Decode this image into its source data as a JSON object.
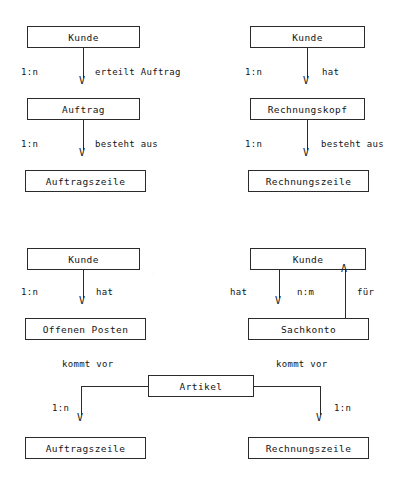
{
  "document": {
    "title": "Entity-Relationship Diagramm",
    "background_color": "#ffffff",
    "line_color": "#2b2b2b",
    "text_color": "#141414"
  },
  "entities": {
    "kunde_1": {
      "label": "Kunde",
      "x": 27,
      "y": 26,
      "w": 113,
      "h": 22
    },
    "auftrag": {
      "label": "Auftrag",
      "x": 27,
      "y": 98,
      "w": 113,
      "h": 22
    },
    "auftragszeile_1": {
      "label": "Auftragszeile",
      "x": 25,
      "y": 170,
      "w": 121,
      "h": 22
    },
    "kunde_2": {
      "label": "Kunde",
      "x": 250,
      "y": 26,
      "w": 115,
      "h": 22
    },
    "rechnungskopf": {
      "label": "Rechnungskopf",
      "x": 250,
      "y": 98,
      "w": 115,
      "h": 22
    },
    "rechnungszeile_1": {
      "label": "Rechnungszeile",
      "x": 248,
      "y": 170,
      "w": 121,
      "h": 22
    },
    "kunde_3": {
      "label": "Kunde",
      "x": 27,
      "y": 248,
      "w": 113,
      "h": 22
    },
    "offenen_posten": {
      "label": "Offenen Posten",
      "x": 25,
      "y": 318,
      "w": 121,
      "h": 22
    },
    "kunde_4": {
      "label": "Kunde",
      "x": 250,
      "y": 248,
      "w": 116,
      "h": 22
    },
    "sachkonto": {
      "label": "Sachkonto",
      "x": 248,
      "y": 318,
      "w": 121,
      "h": 22
    },
    "artikel": {
      "label": "Artikel",
      "x": 148,
      "y": 375,
      "w": 106,
      "h": 22
    },
    "auftragszeile_2": {
      "label": "Auftragszeile",
      "x": 25,
      "y": 437,
      "w": 121,
      "h": 22
    },
    "rechnungszeile_2": {
      "label": "Rechnungszeile",
      "x": 248,
      "y": 437,
      "w": 121,
      "h": 22
    }
  },
  "relationships": [
    {
      "id": "kunde-erteilt-auftrag",
      "from": "kunde_1",
      "to": "auftrag",
      "cardinality": "1:n",
      "verb": "erteilt Auftrag",
      "direction": "down"
    },
    {
      "id": "auftrag-besteht-aus-auftragszeile",
      "from": "auftrag",
      "to": "auftragszeile_1",
      "cardinality": "1:n",
      "verb": "besteht aus",
      "direction": "down"
    },
    {
      "id": "kunde-hat-rechnungskopf",
      "from": "kunde_2",
      "to": "rechnungskopf",
      "cardinality": "1:n",
      "verb": "hat",
      "direction": "down"
    },
    {
      "id": "rechnungskopf-besteht-aus-rechnungszeile",
      "from": "rechnungskopf",
      "to": "rechnungszeile_1",
      "cardinality": "1:n",
      "verb": "besteht aus",
      "direction": "down"
    },
    {
      "id": "kunde-hat-offenen-posten",
      "from": "kunde_3",
      "to": "offenen_posten",
      "cardinality": "1:n",
      "verb": "hat",
      "direction": "down"
    },
    {
      "id": "kunde-hat-sachkonto",
      "from": "kunde_4",
      "to": "sachkonto",
      "cardinality": "n:m",
      "verb": "hat",
      "direction": "down"
    },
    {
      "id": "sachkonto-fuer-kunde",
      "from": "sachkonto",
      "to": "kunde_4",
      "cardinality": "n:m",
      "verb": "für",
      "direction": "up"
    },
    {
      "id": "artikel-kommt-vor-auftragszeile",
      "from": "artikel",
      "to": "auftragszeile_2",
      "cardinality": "1:n",
      "verb": "kommt vor",
      "direction": "down"
    },
    {
      "id": "artikel-kommt-vor-rechnungszeile",
      "from": "artikel",
      "to": "rechnungszeile_2",
      "cardinality": "1:n",
      "verb": "kommt vor",
      "direction": "down"
    }
  ],
  "labels": {
    "card_1n_a": "1:n",
    "verb_erteilt_auftrag": "erteilt Auftrag",
    "card_1n_b": "1:n",
    "verb_besteht_aus_a": "besteht aus",
    "card_1n_c": "1:n",
    "verb_hat_a": "hat",
    "card_1n_d": "1:n",
    "verb_besteht_aus_b": "besteht aus",
    "card_1n_e": "1:n",
    "verb_hat_b": "hat",
    "verb_hat_c": "hat",
    "card_nm": "n:m",
    "verb_fuer": "für",
    "verb_kommt_vor_left": "kommt vor",
    "verb_kommt_vor_right": "kommt vor",
    "card_1n_f": "1:n",
    "card_1n_g": "1:n"
  },
  "arrow_glyphs": {
    "down": "V",
    "up": "Λ"
  }
}
